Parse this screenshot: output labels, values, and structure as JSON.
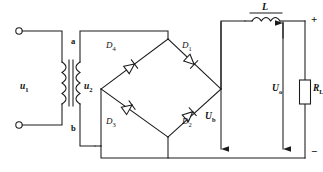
{
  "diagram": {
    "line_color": "#1a1a1a",
    "background_color": "#ffffff"
  },
  "source": {
    "primary_label": "u",
    "primary_sub": "1",
    "secondary_label": "u",
    "secondary_sub": "2",
    "terminal_top": "input-terminal-top",
    "terminal_bottom": "input-terminal-bottom"
  },
  "transformer": {
    "tap_a": "a",
    "tap_b": "b"
  },
  "bridge": {
    "diodes": [
      {
        "id": "D4",
        "label": "D",
        "sub": "4",
        "position": "upper-left"
      },
      {
        "id": "D1",
        "label": "D",
        "sub": "1",
        "position": "upper-right"
      },
      {
        "id": "D3",
        "label": "D",
        "sub": "3",
        "position": "lower-left"
      },
      {
        "id": "D2",
        "label": "D",
        "sub": "2",
        "position": "lower-right"
      }
    ]
  },
  "filter": {
    "inductor_label": "L"
  },
  "load": {
    "resistor_label": "R",
    "resistor_sub": "L"
  },
  "voltages": [
    {
      "id": "Ub",
      "label": "U",
      "sub": "b",
      "description": "rectified bridge output voltage"
    },
    {
      "id": "Uo",
      "label": "U",
      "sub": "o",
      "description": "load output voltage"
    }
  ],
  "polarity": {
    "plus": "+",
    "minus": "−"
  }
}
